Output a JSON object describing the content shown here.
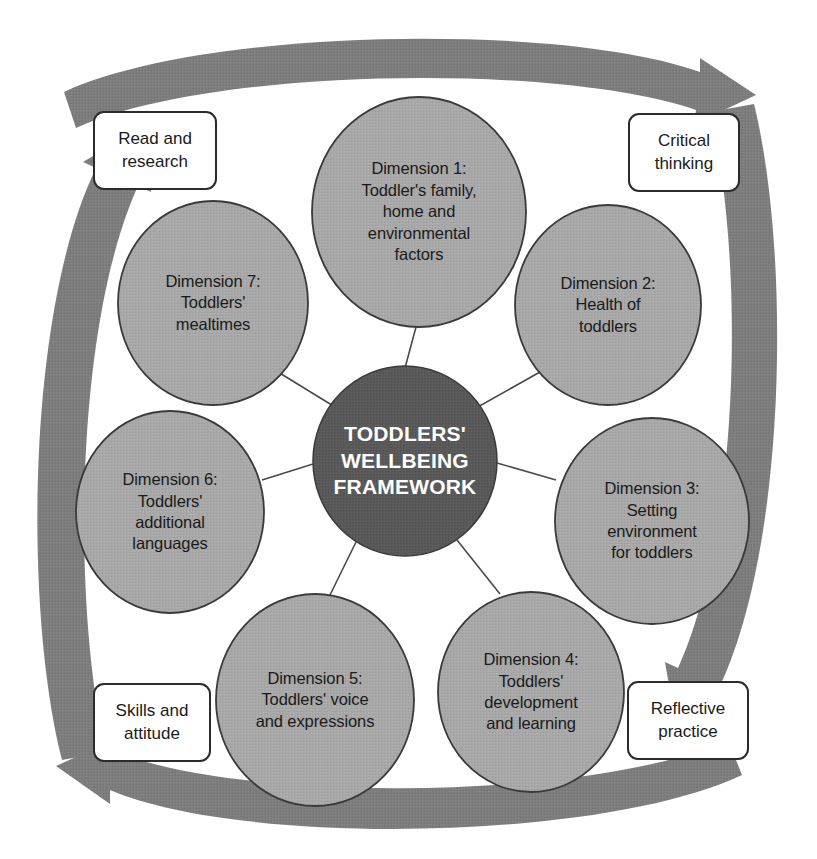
{
  "diagram": {
    "title": "Toddlers' Wellbeing Framework",
    "center": {
      "label": "TODDLERS'\nWELLBEING\nFRAMEWORK",
      "fill": "#595959",
      "text_color": "#ffffff"
    },
    "node_fill": "#a8a8a8",
    "node_stroke": "#3a3a3a",
    "arrow_color": "#7d7d7d",
    "connector_color": "#4a4a4a",
    "dimensions": [
      {
        "id": "dimension-1",
        "label": "Dimension 1:\nToddler's family,\nhome and\nenvironmental\nfactors",
        "cx": 419,
        "cy": 212,
        "rx": 107,
        "ry": 115
      },
      {
        "id": "dimension-2",
        "label": "Dimension 2:\nHealth of\ntoddlers",
        "cx": 608,
        "cy": 305,
        "rx": 93,
        "ry": 100
      },
      {
        "id": "dimension-3",
        "label": "Dimension 3:\nSetting\nenvironment\nfor toddlers",
        "cx": 652,
        "cy": 521,
        "rx": 97,
        "ry": 103
      },
      {
        "id": "dimension-4",
        "label": "Dimension 4:\nToddlers'\ndevelopment\nand learning",
        "cx": 531,
        "cy": 692,
        "rx": 93,
        "ry": 100
      },
      {
        "id": "dimension-5",
        "label": "Dimension 5:\nToddlers' voice\nand expressions",
        "cx": 315,
        "cy": 700,
        "rx": 99,
        "ry": 106
      },
      {
        "id": "dimension-6",
        "label": "Dimension 6:\nToddlers'\nadditional\nlanguages",
        "cx": 170,
        "cy": 512,
        "rx": 94,
        "ry": 101
      },
      {
        "id": "dimension-7",
        "label": "Dimension 7:\nToddlers'\nmealtimes",
        "cx": 213,
        "cy": 303,
        "rx": 95,
        "ry": 102
      }
    ],
    "corner_labels": [
      {
        "id": "read-and-research",
        "label": "Read and\nresearch",
        "x": 93,
        "y": 111,
        "w": 124,
        "h": 79
      },
      {
        "id": "critical-thinking",
        "label": "Critical\nthinking",
        "x": 628,
        "y": 113,
        "w": 112,
        "h": 79
      },
      {
        "id": "reflective-practice",
        "label": "Reflective\npractice",
        "x": 627,
        "y": 681,
        "w": 122,
        "h": 79
      },
      {
        "id": "skills-and-attitude",
        "label": "Skills and\nattitude",
        "x": 93,
        "y": 683,
        "w": 118,
        "h": 79
      }
    ],
    "cycle_arrows": [
      {
        "id": "arrow-top",
        "direction": "right"
      },
      {
        "id": "arrow-right",
        "direction": "down"
      },
      {
        "id": "arrow-bottom",
        "direction": "left"
      },
      {
        "id": "arrow-left",
        "direction": "up"
      }
    ]
  }
}
